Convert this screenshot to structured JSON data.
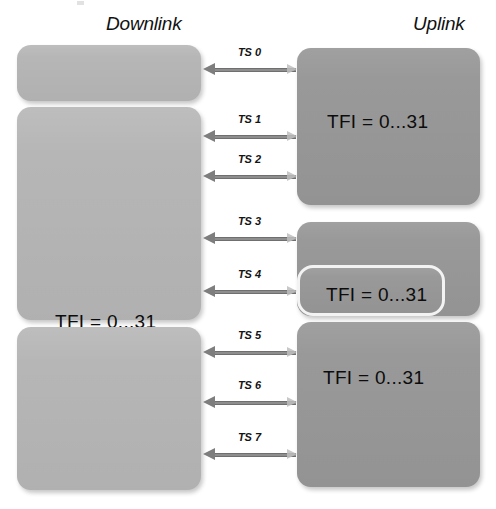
{
  "diagram": {
    "title_downlink": "Downlink",
    "title_uplink": "Uplink",
    "block_label": "TFI = 0...31",
    "colors": {
      "downlink_fill": "#b6b6b6",
      "uplink_fill": "#999999",
      "arrow": "#8e8e8e",
      "text": "#0c0c0c",
      "background": "#ffffff"
    }
  },
  "downlink_blocks": [
    {
      "id": "dl-1",
      "label": "TFI = 0...31",
      "x": 17,
      "y": 45,
      "w": 184,
      "h": 56,
      "label_x": 52,
      "label_y": 63
    },
    {
      "id": "dl-2",
      "label": "TFI = 0...31",
      "x": 17,
      "y": 107,
      "w": 184,
      "h": 213,
      "label_x": 38,
      "label_y": 204
    },
    {
      "id": "dl-3",
      "label": "TFI = 0...31",
      "x": 17,
      "y": 327,
      "w": 184,
      "h": 163,
      "label_x": 38,
      "label_y": 395
    }
  ],
  "uplink_blocks": [
    {
      "id": "ul-1",
      "label": "TFI = 0...31",
      "x": 297,
      "y": 48,
      "w": 183,
      "h": 157,
      "label_x": 30,
      "label_y": 63,
      "nested": false
    },
    {
      "id": "ul-2",
      "label": "",
      "x": 297,
      "y": 222,
      "w": 183,
      "h": 94,
      "label_x": 0,
      "label_y": 0,
      "nested": false
    },
    {
      "id": "ul-2b",
      "label": "TFI = 0...31",
      "x": 297,
      "y": 265,
      "w": 148,
      "h": 51,
      "label_x": 26,
      "label_y": 16,
      "nested": true
    },
    {
      "id": "ul-3",
      "label": "TFI = 0...31",
      "x": 297,
      "y": 322,
      "w": 183,
      "h": 165,
      "label_x": 26,
      "label_y": 45,
      "nested": false
    }
  ],
  "timeslot_arrows": [
    {
      "id": "ts-0",
      "label": "TS 0",
      "y": 70,
      "x1": 203,
      "x2": 296
    },
    {
      "id": "ts-1",
      "label": "TS 1",
      "y": 137,
      "x1": 203,
      "x2": 296
    },
    {
      "id": "ts-2",
      "label": "TS 2",
      "y": 177,
      "x1": 203,
      "x2": 296
    },
    {
      "id": "ts-3",
      "label": "TS 3",
      "y": 239,
      "x1": 203,
      "x2": 296
    },
    {
      "id": "ts-4",
      "label": "TS 4",
      "y": 292,
      "x1": 203,
      "x2": 296
    },
    {
      "id": "ts-5",
      "label": "TS 5",
      "y": 353,
      "x1": 203,
      "x2": 296
    },
    {
      "id": "ts-6",
      "label": "TS 6",
      "y": 403,
      "x1": 203,
      "x2": 296
    },
    {
      "id": "ts-7",
      "label": "TS 7",
      "y": 455,
      "x1": 203,
      "x2": 296
    }
  ]
}
